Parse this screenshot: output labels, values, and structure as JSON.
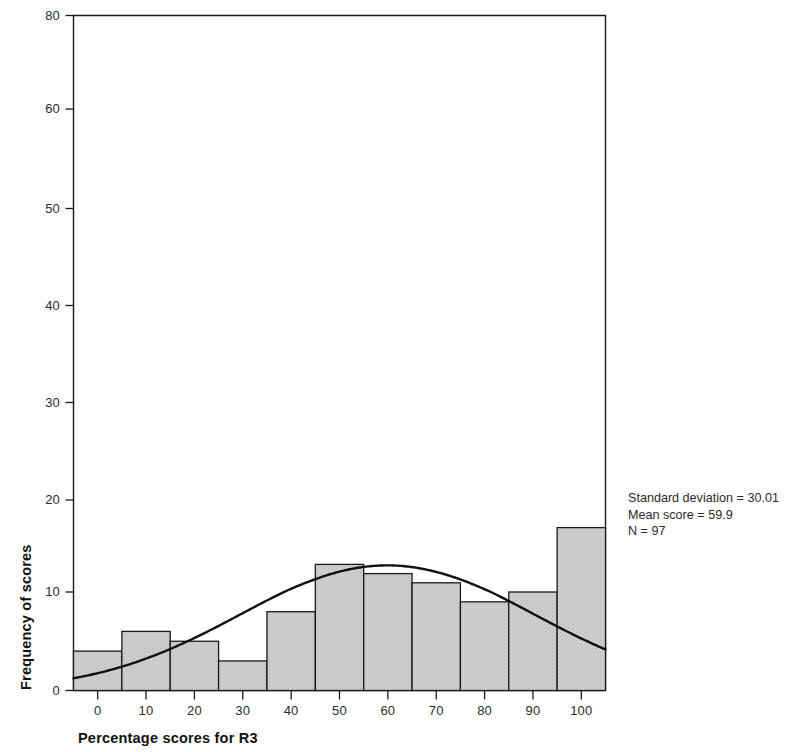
{
  "chart_data": {
    "type": "bar",
    "title": "",
    "subtitle": "",
    "xlabel": "Percentage scores for R3",
    "ylabel": "Frequency of scores",
    "categories": [
      "0",
      "10",
      "20",
      "30",
      "40",
      "50",
      "60",
      "70",
      "80",
      "90",
      "100"
    ],
    "x": [
      0,
      10,
      20,
      30,
      40,
      50,
      60,
      70,
      80,
      90,
      100
    ],
    "values": [
      4,
      6,
      5,
      3,
      8,
      13,
      12,
      11,
      9,
      10,
      17
    ],
    "bin_width": 10,
    "bin_edges": [
      -5,
      5,
      15,
      25,
      35,
      45,
      55,
      65,
      75,
      85,
      95,
      105
    ],
    "xlim": [
      -5,
      105
    ],
    "ylim": [
      0,
      80
    ],
    "xticks": [
      0,
      10,
      20,
      30,
      40,
      50,
      60,
      70,
      80,
      90,
      100
    ],
    "xtick_labels": [
      "0",
      "10",
      "20",
      "30",
      "40",
      "50",
      "60",
      "70",
      "80",
      "90",
      "100"
    ],
    "yticks": [
      0,
      10,
      20,
      30,
      40,
      50,
      60,
      80
    ],
    "ytick_labels": [
      "0",
      "10",
      "20",
      "30",
      "40",
      "50",
      "60",
      "80"
    ],
    "grid": false,
    "legend": null,
    "bar_fill_color": "#cccccc",
    "bar_edge_color": "#1a1a1a",
    "curve_color": "#111111",
    "overlay": {
      "type": "line",
      "name": "normal-curve",
      "description": "fitted normal distribution curve",
      "mean": 59.9,
      "std": 30.01,
      "n": 97,
      "scale_bin_width": 10
    },
    "annotations": [
      "Standard deviation = 30.01",
      "Mean score = 59.9",
      "N = 97"
    ]
  },
  "annotation_box": {
    "std_line": "Standard deviation = 30.01",
    "mean_line": "Mean score = 59.9",
    "n_line": "N = 97"
  },
  "axes": {
    "x_title": "Percentage scores for R3",
    "y_title": "Frequency of scores"
  }
}
